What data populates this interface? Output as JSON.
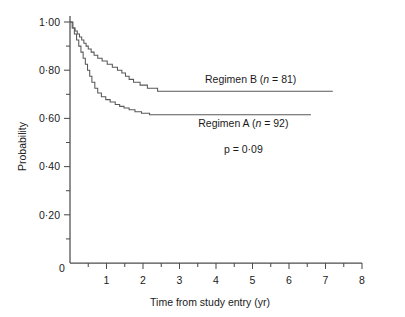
{
  "chart_data": {
    "type": "line",
    "subtype": "kaplan-meier-step",
    "title": "",
    "xlabel": "Time from study entry (yr)",
    "ylabel": "Probability",
    "xlim": [
      0,
      8
    ],
    "ylim": [
      0,
      1.0
    ],
    "grid": false,
    "legend_position": "inline-annotation",
    "x_ticks": [
      0,
      1,
      2,
      3,
      4,
      5,
      6,
      7,
      8
    ],
    "x_tick_labels": [
      "0",
      "1",
      "2",
      "3",
      "4",
      "5",
      "6",
      "7",
      "8"
    ],
    "x_minor_tick_step": 0.5,
    "y_ticks": [
      0.2,
      0.4,
      0.6,
      0.8,
      1.0
    ],
    "y_tick_labels": [
      "0·20",
      "0·40",
      "0·60",
      "0·80",
      "1·00"
    ],
    "y_minor_tick_step": 0.1,
    "annotations": [
      {
        "name": "regimen-b-label",
        "text": "Regimen B (n = 81)",
        "lead": "Regimen B (",
        "italic": "n",
        "tail": " = 81)",
        "x": 4.95,
        "y": 0.745
      },
      {
        "name": "regimen-a-label",
        "text": "Regimen A (n = 92)",
        "lead": "Regimen A (",
        "italic": "n",
        "tail": " = 92)",
        "x": 4.75,
        "y": 0.565
      },
      {
        "name": "p-value-label",
        "text": "p = 0·09",
        "x": 4.75,
        "y": 0.455
      }
    ],
    "series": [
      {
        "name": "Regimen B",
        "n": 81,
        "color": "#58585a",
        "final_probability": 0.713,
        "points": [
          [
            0.0,
            1.0
          ],
          [
            0.08,
            1.0
          ],
          [
            0.08,
            0.975
          ],
          [
            0.14,
            0.975
          ],
          [
            0.14,
            0.963
          ],
          [
            0.2,
            0.963
          ],
          [
            0.2,
            0.95
          ],
          [
            0.26,
            0.95
          ],
          [
            0.26,
            0.938
          ],
          [
            0.32,
            0.938
          ],
          [
            0.32,
            0.925
          ],
          [
            0.38,
            0.925
          ],
          [
            0.38,
            0.912
          ],
          [
            0.44,
            0.912
          ],
          [
            0.44,
            0.9
          ],
          [
            0.5,
            0.9
          ],
          [
            0.5,
            0.888
          ],
          [
            0.58,
            0.888
          ],
          [
            0.58,
            0.875
          ],
          [
            0.66,
            0.875
          ],
          [
            0.66,
            0.862
          ],
          [
            0.76,
            0.862
          ],
          [
            0.76,
            0.85
          ],
          [
            0.88,
            0.85
          ],
          [
            0.88,
            0.838
          ],
          [
            1.02,
            0.838
          ],
          [
            1.02,
            0.825
          ],
          [
            1.16,
            0.825
          ],
          [
            1.16,
            0.812
          ],
          [
            1.3,
            0.812
          ],
          [
            1.3,
            0.8
          ],
          [
            1.42,
            0.8
          ],
          [
            1.42,
            0.788
          ],
          [
            1.52,
            0.788
          ],
          [
            1.52,
            0.775
          ],
          [
            1.62,
            0.775
          ],
          [
            1.62,
            0.762
          ],
          [
            1.74,
            0.762
          ],
          [
            1.74,
            0.75
          ],
          [
            1.92,
            0.75
          ],
          [
            1.92,
            0.738
          ],
          [
            2.12,
            0.738
          ],
          [
            2.12,
            0.725
          ],
          [
            2.4,
            0.725
          ],
          [
            2.4,
            0.713
          ],
          [
            7.2,
            0.713
          ]
        ]
      },
      {
        "name": "Regimen A",
        "n": 92,
        "color": "#58585a",
        "final_probability": 0.615,
        "points": [
          [
            0.0,
            1.0
          ],
          [
            0.06,
            1.0
          ],
          [
            0.06,
            0.975
          ],
          [
            0.12,
            0.975
          ],
          [
            0.12,
            0.95
          ],
          [
            0.18,
            0.95
          ],
          [
            0.18,
            0.925
          ],
          [
            0.24,
            0.925
          ],
          [
            0.24,
            0.9
          ],
          [
            0.3,
            0.9
          ],
          [
            0.3,
            0.875
          ],
          [
            0.36,
            0.875
          ],
          [
            0.36,
            0.85
          ],
          [
            0.42,
            0.85
          ],
          [
            0.42,
            0.825
          ],
          [
            0.48,
            0.825
          ],
          [
            0.48,
            0.8
          ],
          [
            0.54,
            0.8
          ],
          [
            0.54,
            0.775
          ],
          [
            0.6,
            0.775
          ],
          [
            0.6,
            0.75
          ],
          [
            0.68,
            0.75
          ],
          [
            0.68,
            0.725
          ],
          [
            0.76,
            0.725
          ],
          [
            0.76,
            0.705
          ],
          [
            0.86,
            0.705
          ],
          [
            0.86,
            0.69
          ],
          [
            0.98,
            0.69
          ],
          [
            0.98,
            0.678
          ],
          [
            1.1,
            0.678
          ],
          [
            1.1,
            0.668
          ],
          [
            1.24,
            0.668
          ],
          [
            1.24,
            0.658
          ],
          [
            1.36,
            0.658
          ],
          [
            1.36,
            0.65
          ],
          [
            1.48,
            0.65
          ],
          [
            1.48,
            0.643
          ],
          [
            1.62,
            0.643
          ],
          [
            1.62,
            0.636
          ],
          [
            1.78,
            0.636
          ],
          [
            1.78,
            0.628
          ],
          [
            1.96,
            0.628
          ],
          [
            1.96,
            0.621
          ],
          [
            2.18,
            0.621
          ],
          [
            2.18,
            0.615
          ],
          [
            6.6,
            0.615
          ]
        ]
      }
    ]
  }
}
